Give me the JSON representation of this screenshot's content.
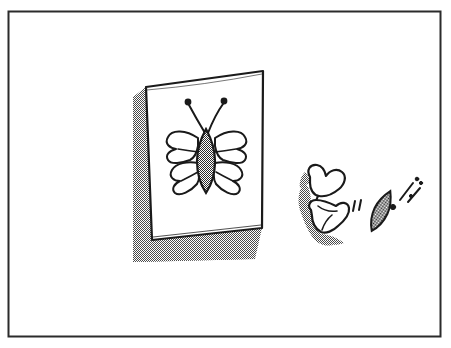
{
  "illustration": {
    "title": "Butterfly poster with butterfly flying away",
    "medium": "black ink line drawing with dithered halftone shading",
    "background_color": "#ffffff",
    "ink_color": "#1a1a1a",
    "shadow_color": "#8a8a8a",
    "frame": {
      "name": "outer-border",
      "x": 8,
      "y": 11,
      "width": 433,
      "height": 326,
      "stroke_color": "#2b2b2b",
      "stroke_width": 2,
      "fill": "none"
    },
    "poster": {
      "name": "wall-poster",
      "description": "rectangular sheet of paper tilted slightly, pinned on a wall",
      "corners": {
        "top_left": [
          146,
          87
        ],
        "top_right": [
          263,
          71
        ],
        "bottom_right": [
          262,
          228
        ],
        "bottom_left": [
          152,
          240
        ]
      },
      "fill": "#ffffff",
      "stroke_color": "#1a1a1a",
      "stroke_width": 2.2,
      "shadow": {
        "name": "poster-drop-shadow",
        "description": "dithered checkerboard grey cast shadow down and to the left, extending below the sheet",
        "offset_x": -14,
        "offset_y": 18,
        "pattern": "checkerboard-dither"
      }
    },
    "drawn_butterfly": {
      "name": "butterfly-drawing",
      "description": "simple butterfly drawn on the poster, four lobed wings and a stippled oval body with two curved antennae ending in dots",
      "center": [
        207,
        160
      ],
      "body": {
        "name": "butterfly-body",
        "shape": "vertical pointed ellipse",
        "cx": 206,
        "cy": 161,
        "rx": 9,
        "ry": 32,
        "fill": "checkerboard-dither"
      },
      "antennae": [
        {
          "name": "antenna-left",
          "from": [
            204,
            132
          ],
          "to": [
            188,
            103
          ],
          "tip_dot_radius": 3
        },
        {
          "name": "antenna-right",
          "from": [
            208,
            132
          ],
          "to": [
            224,
            101
          ],
          "tip_dot_radius": 3
        }
      ],
      "wings": [
        {
          "name": "wing-upper-left",
          "side": "left",
          "position": "upper"
        },
        {
          "name": "wing-upper-right",
          "side": "right",
          "position": "upper"
        },
        {
          "name": "wing-lower-left",
          "side": "left",
          "position": "lower"
        },
        {
          "name": "wing-lower-right",
          "side": "right",
          "position": "lower"
        }
      ]
    },
    "flying_butterfly": {
      "name": "flying-butterfly",
      "description": "the butterfly escaped from the poster, wings seen in motion at the right, with a detached stippled body and speed marks",
      "wings": [
        {
          "name": "flying-wing-upper",
          "description": "heart-lobed wing shape tilted, upper"
        },
        {
          "name": "flying-wing-lower",
          "description": "heart-lobed wing shape tilted, lower"
        }
      ],
      "wing_shadow": {
        "name": "flying-butterfly-shadow",
        "description": "dithered grey shading behind and below the flapping wings",
        "pattern": "checkerboard-dither"
      },
      "detached_body": {
        "name": "flying-butterfly-body",
        "shape": "tilted pointed ellipse",
        "cx": 381,
        "cy": 211,
        "rx": 7,
        "ry": 22,
        "rotation_deg": 25,
        "fill": "checkerboard-dither"
      },
      "motion_marks": [
        {
          "name": "motion-tick-left-1",
          "type": "short-vertical-tick"
        },
        {
          "name": "motion-tick-left-2",
          "type": "short-vertical-tick"
        },
        {
          "name": "motion-dot",
          "type": "dot"
        },
        {
          "name": "motion-stroke-1",
          "type": "diagonal-stroke"
        },
        {
          "name": "motion-stroke-2",
          "type": "diagonal-stroke"
        },
        {
          "name": "motion-speck-1",
          "type": "dot"
        },
        {
          "name": "motion-speck-2",
          "type": "dot"
        }
      ]
    }
  }
}
